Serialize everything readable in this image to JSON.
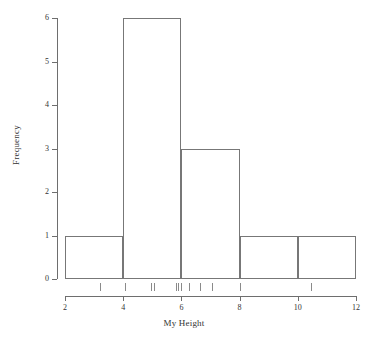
{
  "chart_data": {
    "type": "bar",
    "title": "",
    "subtitle": "",
    "xlabel": "My Height",
    "ylabel": "Frequency",
    "xlim": [
      2,
      12
    ],
    "ylim": [
      0,
      6
    ],
    "grid": false,
    "legend": null,
    "bin_width": 2,
    "bin_edges": [
      2,
      4,
      6,
      8,
      10,
      12
    ],
    "categories": [
      "2-4",
      "4-6",
      "6-8",
      "8-10",
      "10-12"
    ],
    "values": [
      1,
      6,
      3,
      1,
      1
    ],
    "bars": [
      {
        "x0": 2,
        "x1": 4,
        "height": 1
      },
      {
        "x0": 4,
        "x1": 6,
        "height": 6
      },
      {
        "x0": 6,
        "x1": 8,
        "height": 3
      },
      {
        "x0": 8,
        "x1": 10,
        "height": 1
      },
      {
        "x0": 10,
        "x1": 12,
        "height": 1
      }
    ],
    "xticks": [
      2,
      4,
      6,
      8,
      10,
      12
    ],
    "xticklabels": [
      "2",
      "4",
      "6",
      "8",
      "10",
      "12"
    ],
    "yticks": [
      0,
      1,
      2,
      3,
      4,
      5,
      6
    ],
    "yticklabels": [
      "0",
      "1",
      "2",
      "3",
      "4",
      "5",
      "6"
    ],
    "rug": {
      "label": "rug-plot",
      "values": [
        3.2,
        4.05,
        4.95,
        5.05,
        5.8,
        5.9,
        6.0,
        6.25,
        6.65,
        7.05,
        8.0,
        10.45
      ]
    },
    "style": {
      "bar_fill": "none",
      "bar_edge_color": "#777777",
      "axis_color": "#6e6e6e",
      "text_color": "#333333",
      "background": "#ffffff"
    }
  }
}
